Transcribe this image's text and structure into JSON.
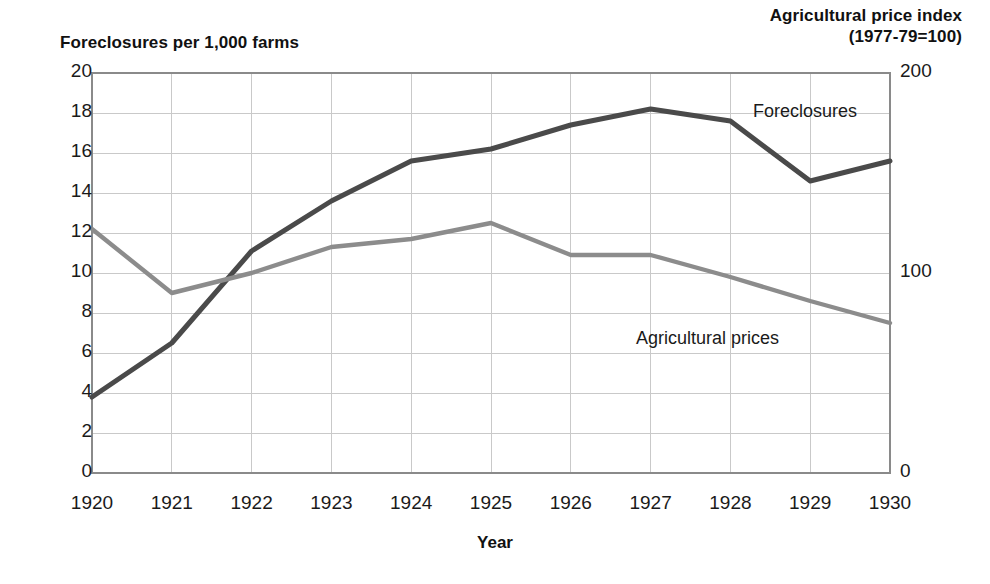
{
  "chart_data": {
    "type": "line",
    "title": "",
    "xlabel": "Year",
    "ylabel": "Foreclosures per 1,000 farms",
    "y2label": "Agricultural price index (1977-79=100)",
    "grid": true,
    "legend_position": "inline-annotations",
    "x": [
      1920,
      1921,
      1922,
      1923,
      1924,
      1925,
      1926,
      1927,
      1928,
      1929,
      1930
    ],
    "xtick_labels": [
      "1920",
      "1921",
      "1922",
      "1923",
      "1924",
      "1925",
      "1926",
      "1927",
      "1928",
      "1929",
      "1930"
    ],
    "ylim": [
      0,
      20
    ],
    "ytick_labels": [
      "0",
      "2",
      "4",
      "6",
      "8",
      "10",
      "12",
      "14",
      "16",
      "18",
      "20"
    ],
    "ytick_values": [
      0,
      2,
      4,
      6,
      8,
      10,
      12,
      14,
      16,
      18,
      20
    ],
    "y2lim": [
      0,
      200
    ],
    "y2tick_labels": [
      "0",
      "100",
      "200"
    ],
    "y2tick_values": [
      0,
      100,
      200
    ],
    "series": [
      {
        "name": "Foreclosures",
        "axis": "left",
        "color": "#4a4a4a",
        "unit": "foreclosures per 1,000 farms",
        "values": [
          3.8,
          6.5,
          11.1,
          13.6,
          15.6,
          16.2,
          17.4,
          18.2,
          17.6,
          14.6,
          15.6
        ]
      },
      {
        "name": "Agricultural prices",
        "axis": "right",
        "color": "#8c8c8c",
        "unit": "index (1977-79=100)",
        "values_left_scale": [
          12.2,
          9.0,
          10.0,
          11.3,
          11.7,
          12.5,
          10.9,
          10.9,
          9.8,
          8.6,
          7.5
        ],
        "values": [
          122,
          90,
          100,
          113,
          117,
          125,
          109,
          109,
          98,
          86,
          75
        ]
      }
    ],
    "annotations": [
      {
        "text": "Foreclosures",
        "series": "Foreclosures"
      },
      {
        "text": "Agricultural prices",
        "series": "Agricultural prices"
      }
    ]
  },
  "axes": {
    "left_title": "Foreclosures per 1,000 farms",
    "right_title_line1": "Agricultural price index",
    "right_title_line2": "(1977-79=100)",
    "x_title": "Year"
  },
  "colors": {
    "foreclosures": "#4a4a4a",
    "prices": "#8c8c8c",
    "grid": "#c9c9c9",
    "axis": "#8a8a8a",
    "text": "#1a1a1a"
  }
}
